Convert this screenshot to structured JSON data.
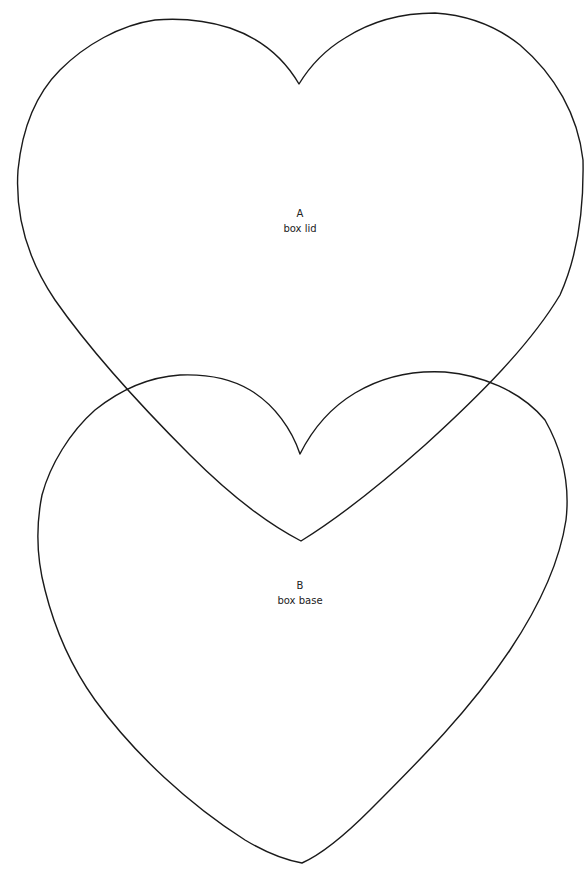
{
  "page": {
    "background": "#ffffff",
    "line_color": "#1a1a1a"
  },
  "templates": [
    {
      "id": "A",
      "letter": "A",
      "caption": "box lid",
      "shape": "heart",
      "label_position": {
        "x": 300,
        "y": 213
      }
    },
    {
      "id": "B",
      "letter": "B",
      "caption": "box base",
      "shape": "heart",
      "label_position": {
        "x": 300,
        "y": 585
      }
    }
  ]
}
